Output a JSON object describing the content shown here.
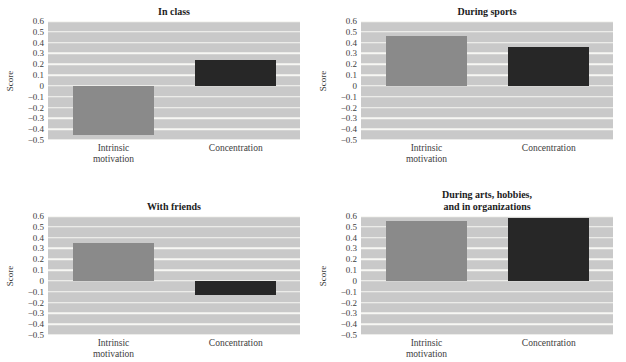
{
  "style": {
    "page_bg": "#ffffff",
    "plot_bg": "#c9c9c9",
    "grid_color": "#f7f7f4",
    "text_color": "#3d3d3d",
    "title_color": "#1c1c1c",
    "intrinsic_bar_color": "#8a8a8a",
    "concentration_bar_color": "#272727"
  },
  "chart_data": [
    {
      "type": "bar",
      "title": "In class",
      "ylabel": "Score",
      "categories": [
        "Intrinsic motivation",
        "Concentration"
      ],
      "category_labels": [
        "Intrinsic\nmotivation",
        "Concentration"
      ],
      "values": [
        -0.45,
        0.24
      ],
      "ylim": [
        -0.5,
        0.6
      ],
      "ytick_labels": [
        "0.6",
        "0.5",
        "0.4",
        "0.3",
        "0.2",
        "0.1",
        "0",
        "−0.1",
        "−0.2",
        "−0.3",
        "−0.4",
        "−0.5"
      ],
      "grid": true,
      "legend": false,
      "bar_colors": [
        "#8a8a8a",
        "#272727"
      ]
    },
    {
      "type": "bar",
      "title": "During sports",
      "ylabel": "Score",
      "categories": [
        "Intrinsic motivation",
        "Concentration"
      ],
      "category_labels": [
        "Intrinsic\nmotivation",
        "Concentration"
      ],
      "values": [
        0.46,
        0.36
      ],
      "ylim": [
        -0.5,
        0.6
      ],
      "ytick_labels": [
        "0.6",
        "0.5",
        "0.4",
        "0.3",
        "0.2",
        "0.1",
        "0",
        "−0.1",
        "−0.2",
        "−0.3",
        "−0.4",
        "−0.5"
      ],
      "grid": true,
      "legend": false,
      "bar_colors": [
        "#8a8a8a",
        "#272727"
      ]
    },
    {
      "type": "bar",
      "title": "With friends",
      "ylabel": "Score",
      "categories": [
        "Intrinsic motivation",
        "Concentration"
      ],
      "category_labels": [
        "Intrinsic\nmotivation",
        "Concentration"
      ],
      "values": [
        0.35,
        -0.13
      ],
      "ylim": [
        -0.5,
        0.6
      ],
      "ytick_labels": [
        "0.6",
        "0.5",
        "0.4",
        "0.3",
        "0.2",
        "0.1",
        "0",
        "−0.1",
        "−0.2",
        "−0.3",
        "−0.4",
        "−0.5"
      ],
      "grid": true,
      "legend": false,
      "bar_colors": [
        "#8a8a8a",
        "#272727"
      ]
    },
    {
      "type": "bar",
      "title": "During arts, hobbies,\nand in organizations",
      "ylabel": "Score",
      "categories": [
        "Intrinsic motivation",
        "Concentration"
      ],
      "category_labels": [
        "Intrinsic\nmotivation",
        "Concentration"
      ],
      "values": [
        0.55,
        0.58
      ],
      "ylim": [
        -0.5,
        0.6
      ],
      "ytick_labels": [
        "0.6",
        "0.5",
        "0.4",
        "0.3",
        "0.2",
        "0.1",
        "0",
        "−0.1",
        "−0.2",
        "−0.3",
        "−0.4",
        "−0.5"
      ],
      "grid": true,
      "legend": false,
      "bar_colors": [
        "#8a8a8a",
        "#272727"
      ]
    }
  ]
}
